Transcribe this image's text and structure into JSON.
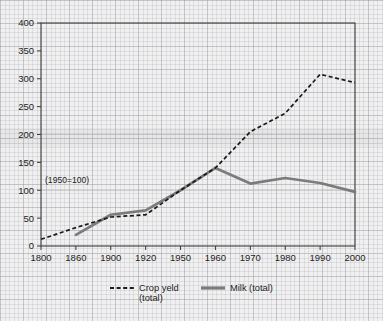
{
  "chart_data": {
    "type": "line",
    "title": "",
    "xlabel": "",
    "ylabel": "",
    "annotation": "(1950=100)",
    "ylim": [
      0,
      400
    ],
    "yticks": [
      0,
      50,
      100,
      150,
      200,
      250,
      300,
      350,
      400
    ],
    "categories": [
      "1800",
      "1860",
      "1900",
      "1920",
      "1950",
      "1960",
      "1970",
      "1980",
      "1990",
      "2000"
    ],
    "axis_type": "ordinal-uneven-years",
    "grid": "minor graph-paper background; faint horizontal lines at 100 and 200",
    "legend_position": "bottom-center",
    "series": [
      {
        "name": "Crop yeld (total)",
        "style": "dashed",
        "color": "#1a1a1a",
        "x": [
          "1800",
          "1860",
          "1900",
          "1920",
          "1950",
          "1960",
          "1970",
          "1980",
          "1990",
          "2000"
        ],
        "values": [
          12,
          33,
          52,
          56,
          100,
          140,
          205,
          238,
          308,
          293
        ]
      },
      {
        "name": "Milk (total)",
        "style": "solid-thick",
        "color": "#7b7b7b",
        "x": [
          "1860",
          "1900",
          "1920",
          "1950",
          "1960",
          "1970",
          "1980",
          "1990",
          "2000"
        ],
        "values": [
          20,
          56,
          64,
          100,
          140,
          112,
          122,
          113,
          97
        ]
      }
    ]
  },
  "axis": {
    "y_tick_labels": [
      "400",
      "350",
      "300",
      "250",
      "200",
      "150",
      "100",
      "50",
      "0"
    ],
    "x_tick_labels": [
      "1800",
      "1860",
      "1900",
      "1920",
      "1950",
      "1960",
      "1970",
      "1980",
      "1990",
      "2000"
    ]
  },
  "annotation": {
    "text": "(1950=100)"
  },
  "legend": {
    "items": [
      {
        "label_line1": "Crop yeld",
        "label_line2": "(total)",
        "swatch": "dashed-line-swatch",
        "color": "#1a1a1a"
      },
      {
        "label_line1": "Milk (total)",
        "label_line2": "",
        "swatch": "solid-line-swatch",
        "color": "#7b7b7b"
      }
    ]
  },
  "colors": {
    "crop_yield": "#1a1a1a",
    "milk": "#7b7b7b",
    "axis": "#333333",
    "background": "#f0f0f0"
  }
}
